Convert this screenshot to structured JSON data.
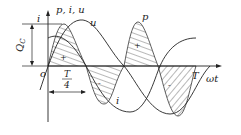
{
  "figure": {
    "axis_labels": {
      "vertical_i": "i",
      "vertical_top": "p, i, u",
      "horizontal": "ωt",
      "origin": "o"
    },
    "curve_labels": {
      "u": "u",
      "p": "p",
      "i": "i"
    },
    "dimensions": {
      "charge": "Q",
      "charge_subscript": "C",
      "quarter_period_num": "T",
      "quarter_period_den": "4",
      "period": "T"
    },
    "signs": {
      "plus1": "+",
      "plus2": "+",
      "minus1": "-",
      "minus2": "-"
    }
  }
}
